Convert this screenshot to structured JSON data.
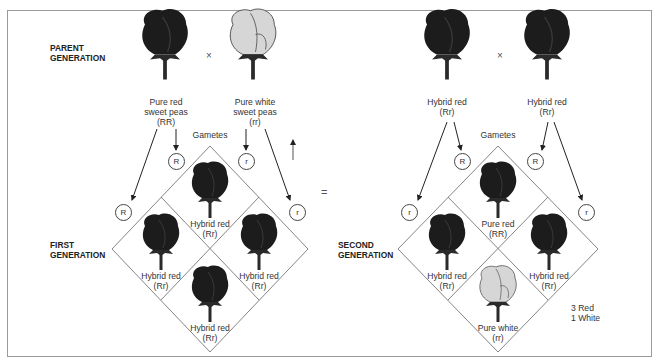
{
  "left_panel": {
    "parent_generation_label": [
      "PARENT",
      "GENERATION"
    ],
    "cross_symbol": "×",
    "parent1": {
      "name": [
        "Pure red",
        "sweet peas"
      ],
      "genotype": "(RR)",
      "color": "red"
    },
    "parent2": {
      "name": [
        "Pure white",
        "sweet peas"
      ],
      "genotype": "(rr)",
      "color": "white"
    },
    "gametes_label": "Gametes",
    "gametes_top": [
      "R",
      "r"
    ],
    "gametes_side": [
      "R",
      "r"
    ],
    "first_generation_label": [
      "FIRST",
      "GENERATION"
    ],
    "offspring": [
      {
        "position": "top",
        "name": "Hybrid red",
        "genotype": "(Rr)",
        "color": "red"
      },
      {
        "position": "left",
        "name": "Hybrid red",
        "genotype": "(Rr)",
        "color": "red"
      },
      {
        "position": "right",
        "name": "Hybrid red",
        "genotype": "(Rr)",
        "color": "red"
      },
      {
        "position": "bottom",
        "name": "Hybrid red",
        "genotype": "(Rr)",
        "color": "red"
      }
    ]
  },
  "equals_symbol": "=",
  "right_panel": {
    "cross_symbol": "×",
    "parent1": {
      "name": "Hybrid red",
      "genotype": "(Rr)",
      "color": "red"
    },
    "parent2": {
      "name": "Hybrid red",
      "genotype": "(Rr)",
      "color": "red"
    },
    "gametes_label": "Gametes",
    "gametes_top": [
      "R",
      "R"
    ],
    "gametes_side": [
      "r",
      "r"
    ],
    "second_generation_label": [
      "SECOND",
      "GENERATION"
    ],
    "offspring": [
      {
        "position": "top",
        "name": "Pure red",
        "genotype": "(RR)",
        "color": "red"
      },
      {
        "position": "left",
        "name": "Hybrid red",
        "genotype": "(Rr)",
        "color": "red"
      },
      {
        "position": "right",
        "name": "Hybrid red",
        "genotype": "(Rr)",
        "color": "red"
      },
      {
        "position": "bottom",
        "name": "Pure white",
        "genotype": "(rr)",
        "color": "white"
      }
    ],
    "ratio": [
      "3 Red",
      "1 White"
    ]
  },
  "colors": {
    "red_flower": "#1c1c1c",
    "white_flower": "#d6d6d6",
    "lines": "#555555"
  }
}
